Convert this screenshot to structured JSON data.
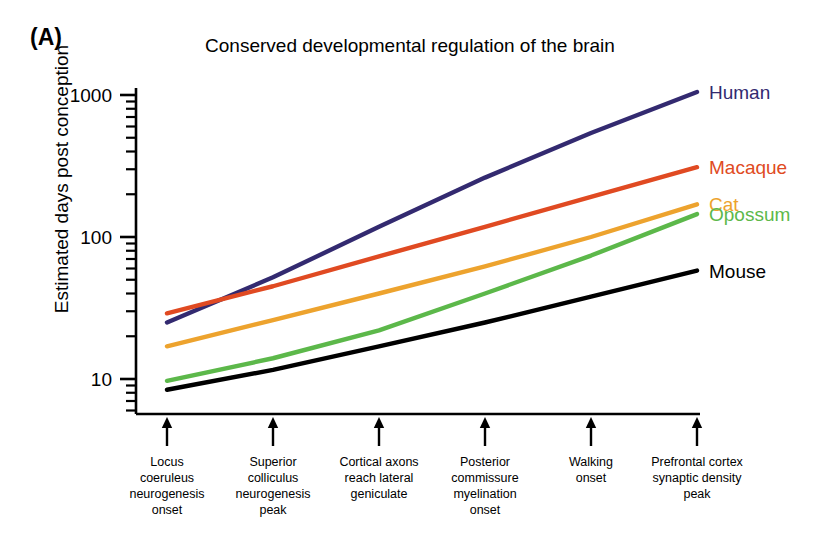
{
  "panel": {
    "label": "(A)"
  },
  "chart_data": {
    "type": "line",
    "title": "Conserved developmental regulation of the brain",
    "xlabel": "",
    "ylabel": "Estimated days post conception",
    "yscale": "log",
    "ylim": [
      7,
      1400
    ],
    "y_major_ticks": [
      "10",
      "100",
      "1000"
    ],
    "y_major_values": [
      10,
      100,
      1000
    ],
    "grid": false,
    "legend_position": "right-inline",
    "categories": [
      "Locus coeruleus neurogenesis onset",
      "Superior colliculus neurogenesis peak",
      "Cortical axons reach lateral geniculate",
      "Posterior commissure myelination onset",
      "Walking onset",
      "Prefrontal cortex synaptic density peak"
    ],
    "x": [
      1,
      2,
      3,
      4,
      5,
      6
    ],
    "series": [
      {
        "name": "Human",
        "color": "#332a70",
        "values": [
          25,
          52,
          118,
          262,
          540,
          1050
        ]
      },
      {
        "name": "Macaque",
        "color": "#e04a22",
        "values": [
          29,
          45,
          73,
          118,
          192,
          310
        ]
      },
      {
        "name": "Cat",
        "color": "#eda32e",
        "values": [
          17,
          26,
          40,
          62,
          100,
          170
        ]
      },
      {
        "name": "Opossum",
        "color": "#5cb84a",
        "values": [
          9.7,
          14,
          22,
          40,
          74,
          145
        ]
      },
      {
        "name": "Mouse",
        "color": "#000000",
        "values": [
          8.4,
          11.6,
          17,
          25,
          38,
          58
        ]
      }
    ]
  },
  "axis": {
    "x_events": [
      {
        "lines": [
          "Locus",
          "coeruleus",
          "neurogenesis",
          "onset"
        ]
      },
      {
        "lines": [
          "Superior",
          "colliculus",
          "neurogenesis",
          "peak"
        ]
      },
      {
        "lines": [
          "Cortical axons",
          "reach lateral",
          "geniculate"
        ]
      },
      {
        "lines": [
          "Posterior",
          "commissure",
          "myelination",
          "onset"
        ]
      },
      {
        "lines": [
          "Walking",
          "onset"
        ]
      },
      {
        "lines": [
          "Prefrontal cortex",
          "synaptic density",
          "peak"
        ]
      }
    ]
  }
}
